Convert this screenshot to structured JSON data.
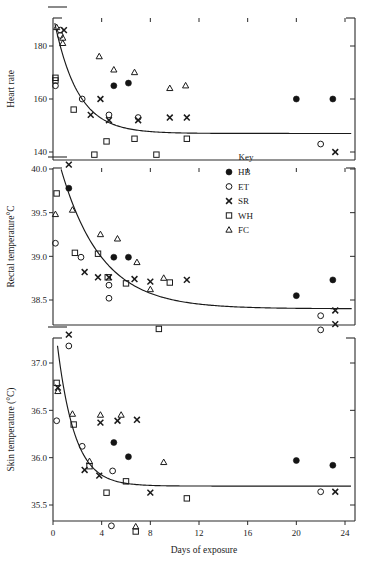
{
  "figure": {
    "title": "",
    "xlabel": "Days of exposure",
    "legend_title": "Key"
  },
  "legend": {
    "title": "Key",
    "entries": [
      {
        "label": "HB",
        "marker": "filled-circle"
      },
      {
        "label": "ET",
        "marker": "open-circle"
      },
      {
        "label": "SR",
        "marker": "cross"
      },
      {
        "label": "WH",
        "marker": "open-square"
      },
      {
        "label": "FC",
        "marker": "open-triangle"
      }
    ]
  },
  "chart_data": [
    {
      "type": "scatter",
      "panel": "top",
      "title": "",
      "ylabel": "Heart rate",
      "xlabel": "Days of exposure",
      "xlim": [
        0,
        25
      ],
      "ylim": [
        134,
        190
      ],
      "xticks": [
        0,
        4,
        8,
        12,
        16,
        20,
        24
      ],
      "yticks": [
        140,
        160,
        180
      ],
      "ytick_labels": [
        "140",
        "160",
        "180"
      ],
      "grid": false,
      "series": [
        {
          "name": "HB",
          "marker": "filled-circle",
          "points": [
            [
              5.0,
              165
            ],
            [
              6.2,
              166
            ],
            [
              20.0,
              160
            ],
            [
              23.0,
              160
            ]
          ]
        },
        {
          "name": "ET",
          "marker": "open-circle",
          "points": [
            [
              0.6,
              184
            ],
            [
              0.6,
              186
            ],
            [
              0.2,
              165
            ],
            [
              2.4,
              160
            ],
            [
              4.6,
              154
            ],
            [
              7.0,
              153
            ],
            [
              22.0,
              143
            ]
          ]
        },
        {
          "name": "SR",
          "marker": "cross",
          "points": [
            [
              0.9,
              186
            ],
            [
              3.1,
              154
            ],
            [
              3.9,
              160
            ],
            [
              4.6,
              152
            ],
            [
              7.0,
              152
            ],
            [
              9.6,
              153
            ],
            [
              11.0,
              153
            ],
            [
              23.2,
              140
            ]
          ]
        },
        {
          "name": "WH",
          "marker": "open-square",
          "points": [
            [
              0.2,
              168
            ],
            [
              0.2,
              167
            ],
            [
              1.7,
              156
            ],
            [
              3.4,
              139
            ],
            [
              4.4,
              144
            ],
            [
              6.7,
              145
            ],
            [
              8.5,
              139
            ],
            [
              11.0,
              145
            ]
          ]
        },
        {
          "name": "FC",
          "marker": "open-triangle",
          "points": [
            [
              0.3,
              187
            ],
            [
              0.8,
              183
            ],
            [
              0.8,
              181
            ],
            [
              3.8,
              176
            ],
            [
              5.0,
              171
            ],
            [
              6.7,
              170
            ],
            [
              9.6,
              164
            ],
            [
              10.9,
              165
            ]
          ]
        }
      ],
      "fit_curve": {
        "description": "decaying exponential fit",
        "asymptote": 147
      }
    },
    {
      "type": "scatter",
      "panel": "middle",
      "title": "",
      "ylabel": "Rectal temperature°C",
      "xlabel": "Days of exposure",
      "xlim": [
        0,
        25
      ],
      "ylim": [
        38.25,
        40.15
      ],
      "xticks": [
        0,
        4,
        8,
        12,
        16,
        20,
        24
      ],
      "yticks": [
        38.5,
        39.0,
        39.5,
        40.0
      ],
      "ytick_labels": [
        "38.5",
        "39.0",
        "39.5",
        "40.0"
      ],
      "grid": false,
      "series": [
        {
          "name": "HB",
          "marker": "filled-circle",
          "points": [
            [
              1.3,
              39.78
            ],
            [
              5.0,
              38.99
            ],
            [
              6.2,
              38.99
            ],
            [
              20.0,
              38.55
            ],
            [
              23.0,
              38.73
            ]
          ]
        },
        {
          "name": "ET",
          "marker": "open-circle",
          "points": [
            [
              0.2,
              39.15
            ],
            [
              2.3,
              38.99
            ],
            [
              4.6,
              38.67
            ],
            [
              4.6,
              38.52
            ],
            [
              22.0,
              38.32
            ]
          ]
        },
        {
          "name": "SR",
          "marker": "cross",
          "points": [
            [
              1.3,
              40.05
            ],
            [
              2.6,
              38.82
            ],
            [
              3.7,
              38.76
            ],
            [
              4.6,
              38.76
            ],
            [
              6.7,
              38.74
            ],
            [
              8.0,
              38.71
            ],
            [
              11.0,
              38.73
            ],
            [
              23.2,
              38.38
            ]
          ]
        },
        {
          "name": "WH",
          "marker": "open-square",
          "points": [
            [
              0.3,
              39.72
            ],
            [
              1.8,
              39.04
            ],
            [
              3.7,
              39.03
            ],
            [
              4.5,
              38.76
            ],
            [
              6.0,
              38.69
            ],
            [
              9.6,
              38.7
            ],
            [
              8.7,
              37.32
            ]
          ]
        },
        {
          "name": "FC",
          "marker": "open-triangle",
          "points": [
            [
              0.2,
              39.48
            ],
            [
              1.6,
              39.53
            ],
            [
              3.9,
              39.25
            ],
            [
              5.3,
              39.2
            ],
            [
              6.9,
              38.93
            ],
            [
              8.0,
              38.62
            ],
            [
              9.1,
              38.75
            ]
          ]
        }
      ],
      "fit_curve": {
        "description": "decaying exponential fit",
        "asymptote": 38.4
      }
    },
    {
      "type": "scatter",
      "panel": "bottom",
      "title": "",
      "ylabel": "Skin temperature (°C)",
      "xlabel": "Days of exposure",
      "xlim": [
        0,
        25
      ],
      "ylim": [
        35.15,
        37.45
      ],
      "xticks": [
        0,
        4,
        8,
        12,
        16,
        20,
        24
      ],
      "yticks": [
        35.5,
        36.0,
        36.5,
        37.0
      ],
      "ytick_labels": [
        "35.5",
        "36.0",
        "36.5",
        "37.0"
      ],
      "grid": false,
      "series": [
        {
          "name": "HB",
          "marker": "filled-circle",
          "points": [
            [
              5.0,
              36.16
            ],
            [
              6.2,
              36.01
            ],
            [
              20.0,
              35.97
            ],
            [
              23.0,
              35.92
            ]
          ]
        },
        {
          "name": "ET",
          "marker": "open-circle",
          "points": [
            [
              1.3,
              37.18
            ],
            [
              0.3,
              36.39
            ],
            [
              2.4,
              36.12
            ],
            [
              4.9,
              35.86
            ],
            [
              22.0,
              35.64
            ],
            [
              4.8,
              35.28
            ],
            [
              22.0,
              37.35
            ]
          ]
        },
        {
          "name": "SR",
          "marker": "cross",
          "points": [
            [
              1.3,
              37.3
            ],
            [
              0.4,
              36.74
            ],
            [
              2.6,
              35.87
            ],
            [
              3.9,
              36.37
            ],
            [
              3.8,
              35.81
            ],
            [
              5.3,
              36.39
            ],
            [
              6.9,
              36.4
            ],
            [
              8.0,
              35.63
            ],
            [
              23.2,
              35.64
            ],
            [
              23.2,
              37.41
            ]
          ]
        },
        {
          "name": "WH",
          "marker": "open-square",
          "points": [
            [
              0.3,
              36.79
            ],
            [
              1.7,
              36.35
            ],
            [
              3.0,
              35.91
            ],
            [
              4.4,
              35.63
            ],
            [
              6.0,
              35.75
            ],
            [
              8.7,
              37.36
            ],
            [
              11.0,
              35.57
            ],
            [
              6.8,
              35.22
            ]
          ]
        },
        {
          "name": "FC",
          "marker": "open-triangle",
          "points": [
            [
              0.4,
              36.7
            ],
            [
              1.6,
              36.46
            ],
            [
              3.0,
              35.96
            ],
            [
              3.9,
              36.45
            ],
            [
              5.6,
              36.45
            ],
            [
              9.1,
              35.95
            ],
            [
              6.8,
              35.27
            ]
          ]
        }
      ],
      "fit_curve": {
        "description": "decaying exponential fit",
        "asymptote": 35.7
      }
    }
  ]
}
